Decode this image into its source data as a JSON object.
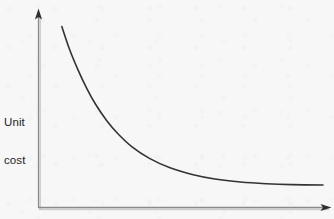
{
  "figure": {
    "background_color": "#f7f7f7",
    "axis_color": "#8a8a8a",
    "axis_shadow_color": "#c9c9c9",
    "curve_color": "#333333",
    "text_color": "#1d1d1d",
    "width": 334,
    "height": 219
  },
  "labels": {
    "y_axis_line1": "Unit",
    "y_axis_line2": "cost",
    "y_axis_full": "Unit cost",
    "x_axis": ""
  },
  "icons": {
    "y_axis_arrow": "arrow-up-icon",
    "x_axis_arrow": "arrow-right-icon"
  },
  "chart_data": {
    "type": "line",
    "title": "",
    "subtitle": "",
    "xlabel": "",
    "ylabel": "Unit cost",
    "grid": false,
    "legend": null,
    "tick_labels": {
      "x": [],
      "y": []
    },
    "axis_style": "arrowed-open-axes",
    "xlim": [
      0,
      1
    ],
    "ylim": [
      0,
      1
    ],
    "series": [
      {
        "name": "Unit cost",
        "color": "#333333",
        "line_width": 1.6,
        "x": [
          0.082,
          0.11,
          0.14,
          0.17,
          0.2,
          0.24,
          0.28,
          0.33,
          0.39,
          0.46,
          0.54,
          0.62,
          0.71,
          0.8,
          0.89,
          1.0
        ],
        "y": [
          0.965,
          0.84,
          0.73,
          0.634,
          0.552,
          0.463,
          0.392,
          0.322,
          0.262,
          0.213,
          0.176,
          0.152,
          0.136,
          0.127,
          0.122,
          0.12
        ]
      }
    ],
    "pixel_geometry": {
      "origin": [
        38.5,
        207.5
      ],
      "y_axis_top": [
        38.5,
        12
      ],
      "x_axis_right": [
        331,
        207.5
      ],
      "curve_start": [
        62,
        20
      ],
      "curve_end": [
        322,
        185
      ],
      "curve_path": "M 62 20 C 70 52, 78 86, 92 112 C 106 139, 124 159, 150 170 C 176 181, 212 184.4, 248 185 C 275 185.4, 300 185.2, 322 185"
    }
  }
}
